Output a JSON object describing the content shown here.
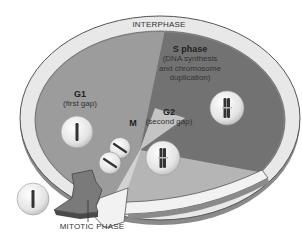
{
  "diagram": {
    "ring_label": "INTERPHASE",
    "phases": [
      {
        "id": "s",
        "title": "S phase",
        "subtitle_lines": [
          "(DNA synthesis",
          "and chromosome",
          "duplication)"
        ]
      },
      {
        "id": "g1",
        "title": "G1",
        "title_main": "G",
        "title_sub": "1",
        "subtitle_lines": [
          "(first gap)"
        ]
      },
      {
        "id": "g2",
        "title": "G2",
        "title_main": "G",
        "title_sub": "2",
        "subtitle_lines": [
          "(second gap)"
        ]
      },
      {
        "id": "m",
        "title": "M"
      }
    ],
    "arrow_label": "MITOTIC PHASE",
    "colors": {
      "ring": "#e6e6e6",
      "ring_edge": "#555555",
      "g1_sector": "#9a9a9a",
      "s_sector": "#6f6f6f",
      "g2_sector": "#b8b8b8",
      "m_sector": "#d0d0d0",
      "cell": "#ececec",
      "chromosome": "#333333",
      "arrow": "#7a7a7a"
    }
  }
}
